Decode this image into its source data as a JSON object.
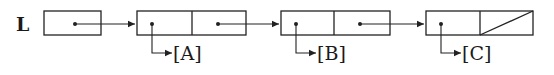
{
  "diagram": {
    "type": "linked-list",
    "head": {
      "label": "L"
    },
    "nodes": [
      {
        "value_label": "[A]",
        "next": "node-2"
      },
      {
        "value_label": "[B]",
        "next": "node-3"
      },
      {
        "value_label": "[C]",
        "next": null
      }
    ],
    "terminator": "null-slash"
  }
}
